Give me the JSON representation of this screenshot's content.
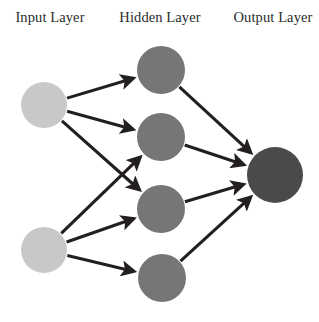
{
  "figure": {
    "background_color": "#ffffff",
    "width": 319,
    "height": 322
  },
  "labels": {
    "input": "Input Layer",
    "hidden": "Hidden Layer",
    "output": "Output Layer"
  },
  "colors": {
    "input_node": "#c8c8c8",
    "hidden_node": "#767676",
    "output_node": "#4a4a4a",
    "edge": "#231f20",
    "label_text": "#2b2b2b"
  },
  "chart_data": {
    "type": "diagram",
    "diagram_kind": "neural-network",
    "layers": [
      {
        "id": "input",
        "label": "Input Layer",
        "label_x": 50,
        "label_y": 22,
        "node_count": 2,
        "node_radius": 23,
        "color": "#c8c8c8",
        "nodes": [
          {
            "id": "i1",
            "cx": 44,
            "cy": 105,
            "r": 23
          },
          {
            "id": "i2",
            "cx": 44,
            "cy": 250,
            "r": 23
          }
        ]
      },
      {
        "id": "hidden",
        "label": "Hidden Layer",
        "label_x": 160,
        "label_y": 22,
        "node_count": 4,
        "node_radius": 24,
        "color": "#767676",
        "nodes": [
          {
            "id": "h1",
            "cx": 161,
            "cy": 70,
            "r": 24
          },
          {
            "id": "h2",
            "cx": 161,
            "cy": 137,
            "r": 24
          },
          {
            "id": "h3",
            "cx": 161,
            "cy": 209,
            "r": 24
          },
          {
            "id": "h4",
            "cx": 162,
            "cy": 278,
            "r": 24
          }
        ]
      },
      {
        "id": "output",
        "label": "Output Layer",
        "label_x": 273,
        "label_y": 22,
        "node_count": 1,
        "node_radius": 28,
        "color": "#4a4a4a",
        "nodes": [
          {
            "id": "o1",
            "cx": 275,
            "cy": 175,
            "r": 28
          }
        ]
      }
    ],
    "edges": [
      {
        "from": "i1",
        "to": "h1"
      },
      {
        "from": "i1",
        "to": "h2"
      },
      {
        "from": "i1",
        "to": "h3"
      },
      {
        "from": "i2",
        "to": "h2"
      },
      {
        "from": "i2",
        "to": "h3"
      },
      {
        "from": "i2",
        "to": "h4"
      },
      {
        "from": "h1",
        "to": "o1"
      },
      {
        "from": "h2",
        "to": "o1"
      },
      {
        "from": "h3",
        "to": "o1"
      },
      {
        "from": "h4",
        "to": "o1"
      }
    ],
    "edge_count": 10,
    "directed": true,
    "arrowheads": true
  }
}
